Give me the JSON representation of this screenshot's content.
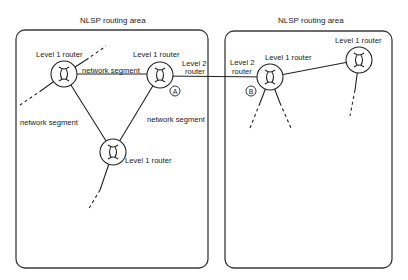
{
  "areas": [
    {
      "id": "left",
      "title": "NLSP routing area"
    },
    {
      "id": "right",
      "title": "NLSP routing area"
    }
  ],
  "routers": [
    {
      "id": "r-left-top",
      "label": "Level 1 router"
    },
    {
      "id": "r-left-mid",
      "label": "Level 1 router",
      "extra_label_line1": "Level 2",
      "extra_label_line2": "router",
      "marker": "A"
    },
    {
      "id": "r-left-bottom",
      "label": "Level 1 router"
    },
    {
      "id": "r-right-b",
      "label": "Level 1 router",
      "extra_label_line1": "Level 2",
      "extra_label_line2": "router",
      "marker": "B"
    },
    {
      "id": "r-right-far",
      "label": "Level 1 router"
    }
  ],
  "segments": {
    "top": "network segment",
    "left": "network segment",
    "right": "network segment"
  }
}
